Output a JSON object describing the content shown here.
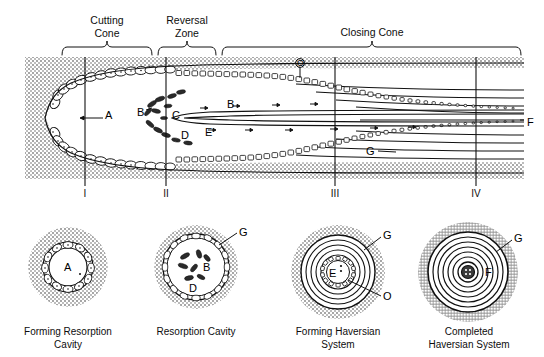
{
  "figure": {
    "title_zones": [
      {
        "id": "cutting-cone",
        "label": "Cutting\nCone",
        "line1": "Cutting",
        "line2": "Cone",
        "brace_x1": 62,
        "brace_x2": 152,
        "text_cx": 107
      },
      {
        "id": "reversal-zone",
        "label": "Reversal\nZone",
        "line1": "Reversal",
        "line2": "Zone",
        "brace_x1": 158,
        "brace_x2": 216,
        "text_cx": 187
      },
      {
        "id": "closing-cone",
        "label": "Closing Cone",
        "line1": "Closing Cone",
        "line2": "",
        "brace_x1": 222,
        "brace_x2": 521,
        "text_cx": 372
      }
    ],
    "section_markers": [
      {
        "label": "I",
        "x": 85
      },
      {
        "label": "II",
        "x": 166
      },
      {
        "label": "III",
        "x": 335
      },
      {
        "label": "IV",
        "x": 476
      }
    ],
    "main_panel_labels": [
      {
        "label": "A",
        "x": 105,
        "y": 110
      },
      {
        "label": "B",
        "x": 138,
        "y": 107
      },
      {
        "label": "C",
        "x": 172,
        "y": 110
      },
      {
        "label": "D",
        "x": 181,
        "y": 130
      },
      {
        "label": "E",
        "x": 205,
        "y": 127
      },
      {
        "label": "B",
        "x": 227,
        "y": 100
      },
      {
        "label": "O",
        "x": 297,
        "y": 58
      },
      {
        "label": "F",
        "x": 527,
        "y": 118
      },
      {
        "label": "G",
        "x": 367,
        "y": 147
      }
    ],
    "cross_sections": [
      {
        "id": "forming-resorption-cavity",
        "caption_line1": "Forming Resorption",
        "caption_line2": "Cavity",
        "cx": 68,
        "cy": 267,
        "caption_cx": 68,
        "inner_labels": [
          {
            "label": "A",
            "dx": 0,
            "dy": 2
          }
        ],
        "outer_labels": []
      },
      {
        "id": "resorption-cavity",
        "caption_line1": "Resorption Cavity",
        "caption_line2": "",
        "cx": 196,
        "cy": 267,
        "caption_cx": 196,
        "inner_labels": [
          {
            "label": "B",
            "dx": 9,
            "dy": 0
          },
          {
            "label": "D",
            "dx": -5,
            "dy": 21
          }
        ],
        "outer_labels": [
          {
            "label": "G",
            "dx": 44,
            "dy": -32
          }
        ]
      },
      {
        "id": "forming-haversian-system",
        "caption_line1": "Forming Haversian",
        "caption_line2": "System",
        "cx": 338,
        "cy": 272,
        "caption_cx": 338,
        "inner_labels": [
          {
            "label": "E",
            "dx": -7,
            "dy": 2
          }
        ],
        "outer_labels": [
          {
            "label": "G",
            "dx": 44,
            "dy": -36
          },
          {
            "label": "O",
            "dx": 44,
            "dy": 12
          }
        ]
      },
      {
        "id": "completed-haversian-system",
        "caption_line1": "Completed",
        "caption_line2": "Haversian System",
        "cx": 468,
        "cy": 272,
        "caption_cx": 468,
        "inner_labels": [
          {
            "label": "F",
            "dx": 18,
            "dy": -2
          }
        ],
        "outer_labels": [
          {
            "label": "G",
            "dx": 46,
            "dy": -34
          }
        ]
      }
    ],
    "colors": {
      "ink": "#111111",
      "stipple": "#9a9a9a",
      "stipple_light": "#c9c9c9",
      "background": "#ffffff",
      "cavity_fill": "#ffffff"
    }
  }
}
